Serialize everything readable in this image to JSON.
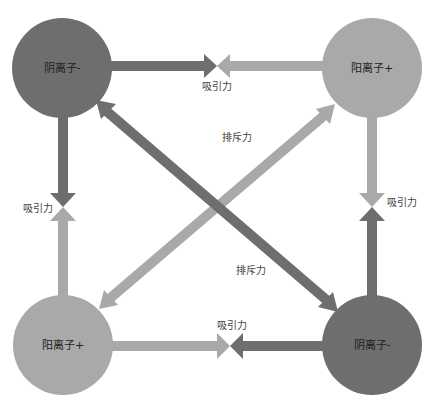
{
  "colors": {
    "anion": "#6e6e6e",
    "cation": "#a9a9a9",
    "background": "#ffffff",
    "label": "#222222"
  },
  "nodes": [
    {
      "id": "top-left",
      "label": "阴离子-",
      "type": "anion",
      "cx": 62,
      "cy": 68,
      "r": 50
    },
    {
      "id": "top-right",
      "label": "阳离子+",
      "type": "cation",
      "cx": 372,
      "cy": 68,
      "r": 50
    },
    {
      "id": "bottom-left",
      "label": "阳离子+",
      "type": "cation",
      "cx": 63,
      "cy": 345,
      "r": 50
    },
    {
      "id": "bottom-right",
      "label": "阴离子-",
      "type": "anion",
      "cx": 372,
      "cy": 345,
      "r": 50
    }
  ],
  "forces": {
    "top": {
      "label": "吸引力",
      "kind": "attraction"
    },
    "left": {
      "label": "吸引力",
      "kind": "attraction"
    },
    "right": {
      "label": "吸引力",
      "kind": "attraction"
    },
    "bottom": {
      "label": "吸引力",
      "kind": "attraction"
    },
    "diag_upper": {
      "label": "排斥力",
      "kind": "repulsion"
    },
    "diag_lower": {
      "label": "排斥力",
      "kind": "repulsion"
    }
  }
}
